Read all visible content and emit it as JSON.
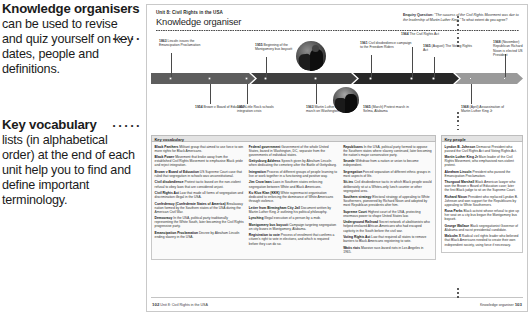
{
  "annotations": [
    {
      "id": "knowledge-organisers",
      "title": "Knowledge organisers",
      "body": "can be used to revise and quiz yourself on key dates, people and definitions."
    },
    {
      "id": "key-vocabulary",
      "title": "Key vocabulary",
      "body": "lists (in alphabetical order) at the end of each unit help you to find and define important terminology."
    }
  ],
  "page": {
    "unit_label": "Unit 8: Civil Rights in the USA",
    "title": "Knowledge organiser",
    "enquiry": {
      "label": "Enquiry Question:",
      "quote": "\"The success of the Civil Rights Movement was due to the leadership of Martin Luther King.\"",
      "prompt": "To what extent do you agree?"
    },
    "footer": {
      "left_page": "102",
      "left_text": "Unit 8: Civil Rights in the USA",
      "right_text": "Knowledge organiser",
      "right_page": "103"
    }
  },
  "timeline": {
    "above": [
      {
        "year": "1863",
        "text": "Lincoln issues the Emancipation Proclamation"
      },
      {
        "year": "1955",
        "text": "Beginning of the Montgomery bus boycott"
      },
      {
        "year": "1961",
        "text": "Civil disobedience campaign to the Freedom Riders"
      },
      {
        "year": "1964",
        "text": "The Civil Rights Act"
      },
      {
        "year": "1965",
        "text": "(August) The Voting Rights Act"
      },
      {
        "year": "1968",
        "text": "(November) Republican Richard Nixon is elected US President"
      }
    ],
    "below": [
      {
        "year": "1954",
        "text": "Brown v Board of Education"
      },
      {
        "year": "1957",
        "text": "Little Rock schools integration crisis"
      },
      {
        "year": "1963",
        "text": "Martin Luther King Jr's march on Washington"
      },
      {
        "year": "1965",
        "text": "(March) Protest march in Selma, Alabama"
      },
      {
        "year": "1968",
        "text": "(April) Assassination of Martin Luther King Jr"
      }
    ]
  },
  "vocabulary": {
    "heading": "Key vocabulary",
    "columns": [
      [
        {
          "term": "Black Panthers",
          "def": "Militant group that aimed to use force to win more rights for Black Americans."
        },
        {
          "term": "Black Power",
          "def": "Movement that broke away from the established Civil Rights Movement to emphasise Black pride and reject integration."
        },
        {
          "term": "Brown v Board of Education",
          "def": "US Supreme Court case that ruled that segregation in schools was unconstitutional."
        },
        {
          "term": "Civil disobedience",
          "def": "Protest tactic based on the non-violent refusal to obey laws that are considered unjust."
        },
        {
          "term": "Civil Rights Act",
          "def": "Law that made all forms of segregation and discrimination illegal in the USA."
        },
        {
          "term": "Confederacy (Confederate States of America)",
          "def": "Breakaway nation formed by the Southern states of the USA during the American Civil War."
        },
        {
          "term": "Democracy",
          "def": "In the USA, political party traditionally representing the White South, later becoming the Civil Rights progressive party."
        },
        {
          "term": "Emancipation Proclamation",
          "def": "Decree by Abraham Lincoln ending slavery in the USA."
        }
      ],
      [
        {
          "term": "Federal government",
          "def": "Government of the whole United States, based in Washington, DC, separate from the governments of individual states."
        },
        {
          "term": "Gettysburg Address",
          "def": "Speech given by Abraham Lincoln when dedicating the cemetery after the Battle of Gettysburg."
        },
        {
          "term": "Integration",
          "def": "Process of different groups of people learning to live or work together in a functioning and positive way."
        },
        {
          "term": "Jim Crow laws",
          "def": "Laws in Southern states enforcing segregation between White and Black Americans."
        },
        {
          "term": "Ku Klux Klan (KKK)",
          "def": "White supremacist organisation dedicated to enforcing the dominance of White Americans through violence."
        },
        {
          "term": "Letter from Birmingham City Jail",
          "def": "Document written by Martin Luther King Jr outlining his political philosophy."
        },
        {
          "term": "Lynching",
          "def": "Illegal execution of a person by a mob."
        },
        {
          "term": "Montgomery bus boycott",
          "def": "Campaign targeting segregation on city buses in Montgomery, Alabama."
        },
        {
          "term": "Registration to vote",
          "def": "Process of enrolment that confirms a citizen's right to vote in elections, and which is required before they can do so."
        }
      ],
      [
        {
          "term": "Republicans",
          "def": "In the USA, political party formed to oppose the Southern states where slavery continued, later becoming the nation's major conservative party."
        },
        {
          "term": "Secede",
          "def": "Withdraw from a nation or union to become independent."
        },
        {
          "term": "Segregation",
          "def": "Forced separation of different ethnic groups in most aspects of life."
        },
        {
          "term": "Sit-ins",
          "def": "Civil disobedience tactic in which Black people would deliberately sit at a Whites-only lunch counter or other segregated area."
        },
        {
          "term": "Southern strategy",
          "def": "Electoral strategy of appealing to White Southerners, pioneered by Richard Nixon and adopted by most Republican presidents after him."
        },
        {
          "term": "Supreme Court",
          "def": "Highest court of the USA, protecting enormous power to shape United States law."
        },
        {
          "term": "Underground Railroad",
          "def": "Secret network of abolitionists who helped enslaved African-Americans who had escaped captivity in the South before the civil war."
        },
        {
          "term": "Voting Rights Act",
          "def": "Law that required all states to remove barriers to Black Americans registering to vote."
        },
        {
          "term": "Watts riots",
          "def": "Massive race-based riots in Los Angeles in 1965."
        }
      ]
    ]
  },
  "people": {
    "heading": "Key people",
    "items": [
      {
        "name": "Lyndon B. Johnson",
        "def": "Democrat President who passed the Civil Rights Act and Voting Rights Act."
      },
      {
        "name": "Martin Luther King Jr",
        "def": "Main leader of the Civil Rights Movement, who emphasised non-violent protest."
      },
      {
        "name": "Abraham Lincoln",
        "def": "President who passed the Emancipation Proclamation."
      },
      {
        "name": "Thurgood Marshall",
        "def": "Black American lawyer who won the Brown v Board of Education case; later the first Black judge to sit on the Supreme Court."
      },
      {
        "name": "Richard Nixon",
        "def": "President who replaced Lyndon B. Johnson and won support for the Republicans by appealing to White Southerners."
      },
      {
        "name": "Rosa Parks",
        "def": "Black activist whose refusal to give up her seat on a city bus began the Montgomery bus boycott."
      },
      {
        "name": "George Wallace",
        "def": "Black segregationist Governor of Alabama and racist presidential candidate."
      },
      {
        "name": "Malcolm X",
        "def": "Radical civil rights leader who believed that Black Americans needed to create their own independent society, using force if necessary."
      }
    ]
  },
  "colors": {
    "band_1": "#5d5d5d",
    "band_2": "#3f3f3f",
    "band_3": "#272727",
    "band_4": "#9a9a9a",
    "panel_header": "#e3e3e3"
  }
}
